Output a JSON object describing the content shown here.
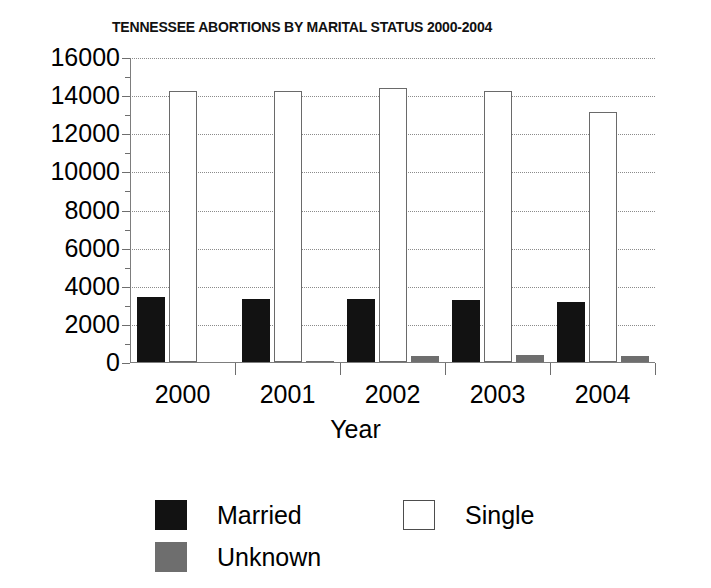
{
  "chart_data": {
    "type": "bar",
    "title": "TENNESSEE ABORTIONS BY MARITAL STATUS 2000-2004",
    "xlabel": "Year",
    "ylabel": "",
    "categories": [
      "2000",
      "2001",
      "2002",
      "2003",
      "2004"
    ],
    "series": [
      {
        "name": "Married",
        "color": "#121212",
        "values": [
          3410,
          3300,
          3300,
          3250,
          3150
        ]
      },
      {
        "name": "Single",
        "color": "#ffffff",
        "values": [
          14200,
          14200,
          14350,
          14200,
          13100
        ]
      },
      {
        "name": "Unknown",
        "color": "#6e6e6e",
        "values": [
          0,
          50,
          300,
          370,
          290
        ]
      }
    ],
    "ylim": [
      0,
      16000
    ],
    "ytick_labels": [
      "16000",
      "14000",
      "12000",
      "10000",
      "8000",
      "6000",
      "4000",
      "2000",
      "0"
    ],
    "ytick_values": [
      16000,
      14000,
      12000,
      10000,
      8000,
      6000,
      4000,
      2000,
      0
    ],
    "yminor_values": [
      15000,
      13000,
      11000,
      9000,
      7000,
      5000,
      3000,
      1000
    ],
    "grid": true,
    "grid_axis": "y",
    "legend_position": "bottom",
    "legend_entries": [
      "Married",
      "Single",
      "Unknown"
    ]
  }
}
